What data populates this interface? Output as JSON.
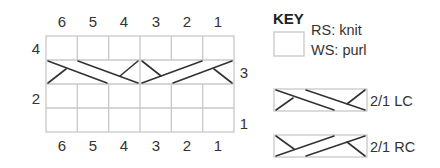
{
  "chart": {
    "column_numbers_top": [
      "6",
      "5",
      "4",
      "3",
      "2",
      "1"
    ],
    "column_numbers_bottom": [
      "6",
      "5",
      "4",
      "3",
      "2",
      "1"
    ],
    "row_labels_left": [
      {
        "row": 4,
        "label": "4"
      },
      {
        "row": 2,
        "label": "2"
      }
    ],
    "row_labels_right": [
      {
        "row": 3,
        "label": "3"
      },
      {
        "row": 1,
        "label": "1"
      }
    ],
    "rows": 4,
    "columns": 6,
    "cable_row": 3,
    "cables": [
      {
        "type": "2/1 LC",
        "stitches": [
          6,
          5,
          4
        ]
      },
      {
        "type": "2/1 RC",
        "stitches": [
          3,
          2,
          1
        ]
      }
    ]
  },
  "key": {
    "title": "KEY",
    "items": [
      {
        "symbol": "empty-square",
        "line1": "RS: knit",
        "line2": "WS: purl"
      },
      {
        "symbol": "2/1-lc",
        "label": "2/1 LC"
      },
      {
        "symbol": "2/1-rc",
        "label": "2/1 RC"
      }
    ]
  },
  "colors": {
    "grid": "#c8c8c8",
    "cable": "#333333",
    "text": "#333333"
  }
}
